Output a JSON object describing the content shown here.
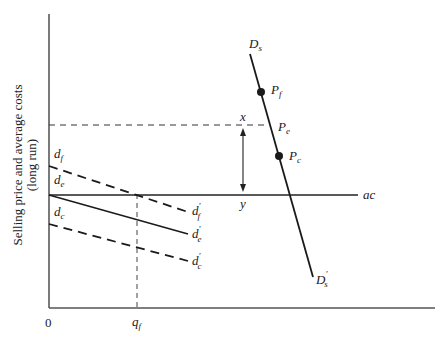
{
  "figure": {
    "y_axis_title_line1": "Selling price and average costs",
    "y_axis_title_line2": "(long run)",
    "origin_label": "0",
    "x_tick_label": "q",
    "x_tick_sub": "f"
  },
  "labels": {
    "Ds": {
      "main": "D",
      "sub": "s"
    },
    "Ds_prime": {
      "main": "D",
      "prime": "'",
      "sub": "s"
    },
    "Pf": {
      "main": "P",
      "sub": "f"
    },
    "Pe": {
      "main": "P",
      "sub": "e"
    },
    "Pc": {
      "main": "P",
      "sub": "c"
    },
    "x": "x",
    "y": "y",
    "ac": "ac",
    "df": {
      "main": "d",
      "sub": "f"
    },
    "de": {
      "main": "d",
      "sub": "e"
    },
    "dc": {
      "main": "d",
      "sub": "c"
    },
    "df_prime": {
      "main": "d",
      "prime": "'",
      "sub": "f"
    },
    "de_prime": {
      "main": "d",
      "prime": "'",
      "sub": "e"
    },
    "dc_prime": {
      "main": "d",
      "prime": "'",
      "sub": "c"
    }
  },
  "colors": {
    "ink": "#1a1a1a",
    "axis": "#333333",
    "background": "#ffffff"
  }
}
